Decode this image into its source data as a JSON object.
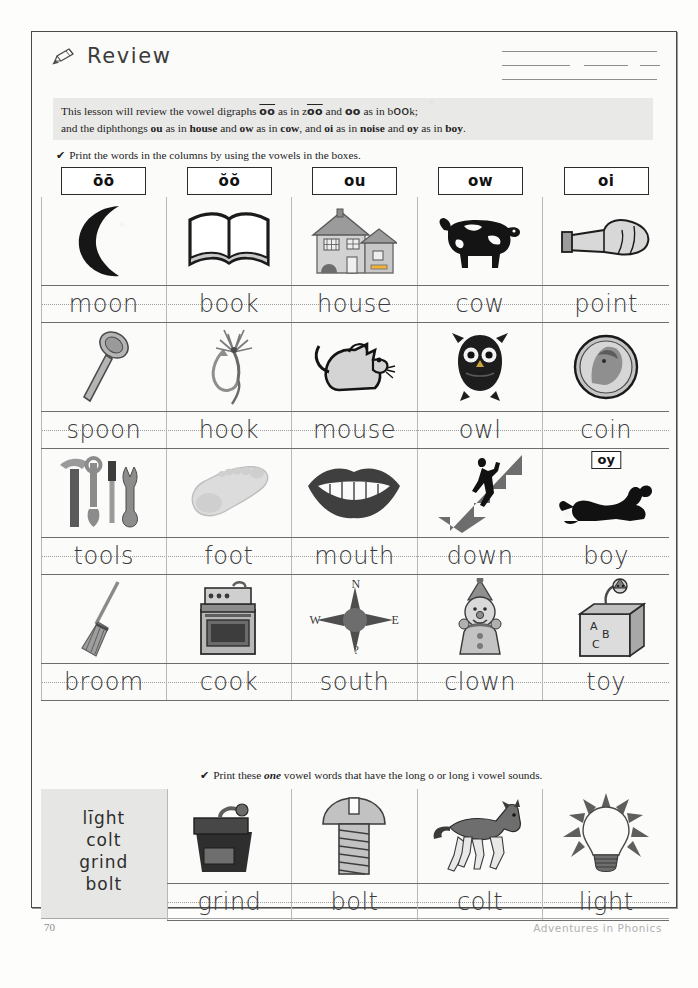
{
  "page": {
    "title": "Review",
    "title_icon": "pencil-icon",
    "page_number": "70",
    "credit": "Adventures in Phonics",
    "name_lines": 3
  },
  "intro": {
    "line1_pre": "This lesson will review the vowel digraphs ",
    "line1_oo_long": "oo",
    "line1_mid": " as in z",
    "line1_zoo_oo": "oo",
    "line1_and": " and ",
    "line1_oo_short": "oo",
    "line1_asin": " as in b",
    "line1_book_oo": "oo",
    "line1_end": "k;",
    "line2_pre": "and the diphthongs ",
    "line2_ou": "ou",
    "line2_a": " as in ",
    "line2_house": "house",
    "line2_b": " and ",
    "line2_ow": "ow",
    "line2_c": " as in ",
    "line2_cow": "cow",
    "line2_d": ", and ",
    "line2_oi": "oi",
    "line2_e": " as in ",
    "line2_noise": "noise",
    "line2_f": " and ",
    "line2_oy": "oy",
    "line2_g": " as in ",
    "line2_boy": "boy",
    "line2_end": "."
  },
  "directions": {
    "check_glyph": "✔",
    "top": "Print the words in the columns by using the vowels in the boxes.",
    "bottom_pre": "Print these ",
    "bottom_em": "one",
    "bottom_post": " vowel words that have the long o or long i vowel sounds."
  },
  "columns": [
    {
      "vowel": "ōō",
      "name": "oo-long"
    },
    {
      "vowel": "ŏŏ",
      "name": "oo-short"
    },
    {
      "vowel": "ou",
      "name": "ou"
    },
    {
      "vowel": "ow",
      "name": "ow"
    },
    {
      "vowel": "oi",
      "name": "oi"
    }
  ],
  "rows": [
    {
      "pictures": [
        "moon-icon",
        "open-book-icon",
        "house-icon",
        "cow-icon",
        "pointing-hand-icon"
      ],
      "answers": [
        "moon",
        "book",
        "house",
        "cow",
        "point"
      ]
    },
    {
      "pictures": [
        "spoon-icon",
        "fishing-hook-icon",
        "mouse-icon",
        "owl-icon",
        "coin-icon"
      ],
      "answers": [
        "spoon",
        "hook",
        "mouse",
        "owl",
        "coin"
      ]
    },
    {
      "pictures": [
        "tools-icon",
        "foot-icon",
        "mouth-icon",
        "down-stairs-icon",
        "boy-icon"
      ],
      "answers": [
        "tools",
        "foot",
        "mouth",
        "down",
        "boy"
      ],
      "extra_box": {
        "column": 4,
        "label": "oy"
      }
    },
    {
      "pictures": [
        "broom-icon",
        "stove-icon",
        "compass-icon",
        "clown-icon",
        "jack-in-the-box-icon"
      ],
      "answers": [
        "broom",
        "cook",
        "south",
        "clown",
        "toy"
      ],
      "compass": {
        "north": "N",
        "west": "W",
        "east": "E",
        "south": "?"
      }
    }
  ],
  "bottom": {
    "word_bank": [
      "līght",
      "colt",
      "grind",
      "bolt"
    ],
    "pictures": [
      "coffee-grinder-icon",
      "bolt-screw-icon",
      "colt-horse-icon",
      "light-bulb-icon"
    ],
    "answers": [
      "grind",
      "bolt",
      "colt",
      "light"
    ]
  },
  "colors": {
    "paper": "#fbfbfa",
    "intro_box": "#e9e9e7",
    "ink": "#3a3a3a",
    "rule": "#6e6e6e"
  }
}
